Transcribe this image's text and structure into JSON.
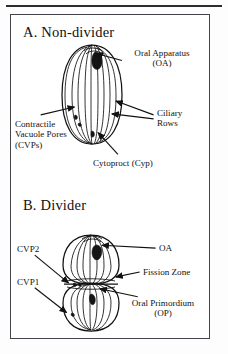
{
  "figure": {
    "top_rule": true,
    "panels": [
      {
        "id": "panel-a",
        "title": "A.  Non-divider",
        "organism": "ciliate cell (non-dividing)",
        "labels": [
          {
            "id": "oral-apparatus",
            "text": "Oral Apparatus\n(OA)"
          },
          {
            "id": "ciliary-rows",
            "text": "Ciliary\nRows"
          },
          {
            "id": "contractile-vacuole-pores",
            "text": "Contractile\nVacuole Pores\n(CVPs)"
          },
          {
            "id": "cytoproct",
            "text": "Cytoproct (Cyp)"
          }
        ]
      },
      {
        "id": "panel-b",
        "title": "B.  Divider",
        "organism": "ciliate cell (dividing)",
        "labels": [
          {
            "id": "cvp2",
            "text": "CVP2"
          },
          {
            "id": "cvp1",
            "text": "CVP1"
          },
          {
            "id": "oa",
            "text": "OA"
          },
          {
            "id": "fission-zone",
            "text": "Fission Zone"
          },
          {
            "id": "oral-primordium",
            "text": "Oral Primordium\n(OP)"
          }
        ]
      }
    ]
  },
  "colors": {
    "ink": "#111111",
    "frame": "#44444a",
    "paper": "#ffffff"
  }
}
